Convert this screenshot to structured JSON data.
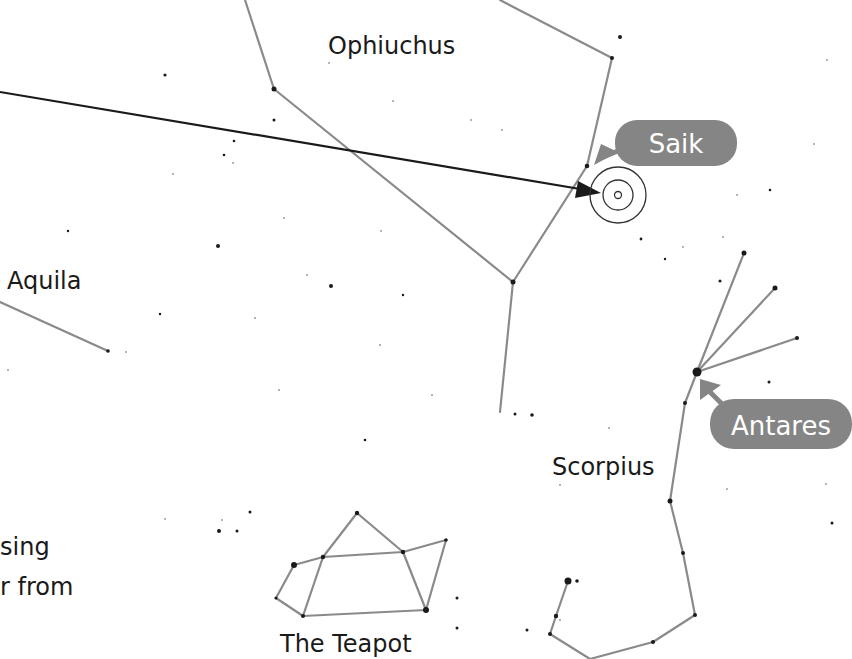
{
  "constellations": {
    "ophiuchus": "Ophiuchus",
    "aquila": "Aquila",
    "scorpius": "Scorpius",
    "teapot": "The Teapot"
  },
  "callouts": {
    "saik": "Saik",
    "antares": "Antares"
  },
  "caption_fragment": {
    "line1": "sing",
    "line2": "r from"
  },
  "colors": {
    "constellation_line": "#8a8a8a",
    "callout_fill": "#858585",
    "star": "#1a1a1a",
    "background": "#ffffff"
  }
}
